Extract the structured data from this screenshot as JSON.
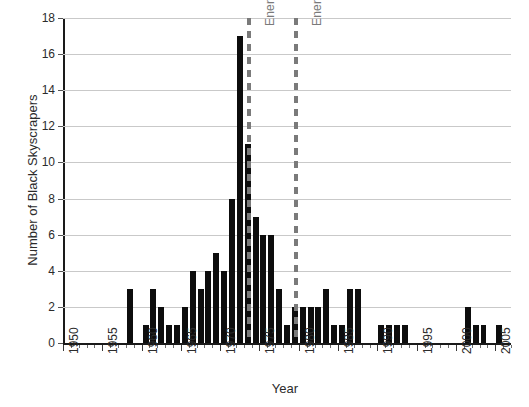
{
  "chart_data": {
    "type": "bar",
    "title": "",
    "xlabel": "Year",
    "ylabel": "Number of Black Skyscrapers",
    "xlim": [
      1950,
      2007
    ],
    "ylim": [
      0,
      18
    ],
    "y_ticks": [
      0,
      2,
      4,
      6,
      8,
      10,
      12,
      14,
      16,
      18
    ],
    "x_ticks": [
      1950,
      1955,
      1960,
      1965,
      1970,
      1975,
      1980,
      1985,
      1990,
      1995,
      2000,
      2005
    ],
    "x_tick_labels": [
      "1950",
      "1955",
      "1960",
      "1965",
      "1970",
      "1975",
      "1980",
      "1985",
      "1990",
      "1995",
      "2000",
      "2005"
    ],
    "grid": "horizontal",
    "legend": "none",
    "bar_color": "#0d0d0d",
    "annotation_color": "#7a7a7a",
    "gridline_color": "#c9c9c9",
    "categories": [
      1950,
      1951,
      1952,
      1953,
      1954,
      1955,
      1956,
      1957,
      1958,
      1959,
      1960,
      1961,
      1962,
      1963,
      1964,
      1965,
      1966,
      1967,
      1968,
      1969,
      1970,
      1971,
      1972,
      1973,
      1974,
      1975,
      1976,
      1977,
      1978,
      1979,
      1980,
      1981,
      1982,
      1983,
      1984,
      1985,
      1986,
      1987,
      1988,
      1989,
      1990,
      1991,
      1992,
      1993,
      1994,
      1995,
      1996,
      1997,
      1998,
      1999,
      2000,
      2001,
      2002,
      2003,
      2004,
      2005,
      2006
    ],
    "values": [
      0,
      0,
      0,
      0,
      0,
      0,
      0,
      0,
      3,
      0,
      1,
      3,
      2,
      1,
      1,
      2,
      4,
      3,
      4,
      5,
      4,
      8,
      17,
      11,
      7,
      6,
      6,
      3,
      1,
      2,
      2,
      2,
      2,
      3,
      1,
      1,
      3,
      3,
      0,
      0,
      1,
      1,
      1,
      1,
      0,
      0,
      0,
      0,
      0,
      0,
      0,
      2,
      1,
      1,
      0,
      1,
      0
    ],
    "annotations": [
      {
        "label": "Energy Crisis 1973",
        "year": 1973,
        "style": "dashed-vertical"
      },
      {
        "label": "Energy Crisis 1979",
        "year": 1979,
        "style": "dashed-vertical"
      }
    ]
  }
}
